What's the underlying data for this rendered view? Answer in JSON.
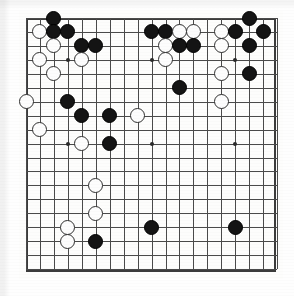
{
  "board": {
    "game": "go",
    "size": 19,
    "title": "Go board position",
    "orientation": "top-left origin, columns 1-19 left to right, rows 1-19 top to bottom",
    "colors": {
      "black_stone": "#141414",
      "white_stone": "#fdfdfd",
      "white_stone_outline": "#2e2e2e",
      "grid_line": "#4a4a4a",
      "border": "#3b3b3b",
      "paper": "#fefefe"
    },
    "geometry": {
      "line1_x": 26,
      "line1_y": 18,
      "cell": 13.95,
      "stone_diameter": 15,
      "border_left": 26,
      "border_top": 18,
      "border_right": 277,
      "border_bottom": 272
    },
    "hoshi": [
      {
        "col": 4,
        "row": 4
      },
      {
        "col": 10,
        "row": 4
      },
      {
        "col": 16,
        "row": 4
      },
      {
        "col": 4,
        "row": 10
      },
      {
        "col": 10,
        "row": 10
      },
      {
        "col": 16,
        "row": 10
      },
      {
        "col": 4,
        "row": 16
      },
      {
        "col": 10,
        "row": 16
      },
      {
        "col": 16,
        "row": 16
      }
    ],
    "counts": {
      "black": 24,
      "white": 16,
      "total": 40
    },
    "stones": [
      {
        "color": "black",
        "col": 3,
        "row": 1
      },
      {
        "color": "black",
        "col": 17,
        "row": 1
      },
      {
        "color": "white",
        "col": 2,
        "row": 2
      },
      {
        "color": "black",
        "col": 3,
        "row": 2
      },
      {
        "color": "black",
        "col": 4,
        "row": 2
      },
      {
        "color": "black",
        "col": 10,
        "row": 2
      },
      {
        "color": "black",
        "col": 11,
        "row": 2
      },
      {
        "color": "white",
        "col": 12,
        "row": 2
      },
      {
        "color": "white",
        "col": 13,
        "row": 2
      },
      {
        "color": "white",
        "col": 15,
        "row": 2
      },
      {
        "color": "black",
        "col": 16,
        "row": 2
      },
      {
        "color": "black",
        "col": 18,
        "row": 2
      },
      {
        "color": "white",
        "col": 3,
        "row": 3
      },
      {
        "color": "black",
        "col": 5,
        "row": 3
      },
      {
        "color": "black",
        "col": 6,
        "row": 3
      },
      {
        "color": "white",
        "col": 11,
        "row": 3
      },
      {
        "color": "black",
        "col": 12,
        "row": 3
      },
      {
        "color": "black",
        "col": 13,
        "row": 3
      },
      {
        "color": "white",
        "col": 15,
        "row": 3
      },
      {
        "color": "black",
        "col": 17,
        "row": 3
      },
      {
        "color": "white",
        "col": 2,
        "row": 4
      },
      {
        "color": "white",
        "col": 5,
        "row": 4
      },
      {
        "color": "white",
        "col": 11,
        "row": 4
      },
      {
        "color": "white",
        "col": 3,
        "row": 5
      },
      {
        "color": "white",
        "col": 15,
        "row": 5
      },
      {
        "color": "black",
        "col": 17,
        "row": 5
      },
      {
        "color": "black",
        "col": 12,
        "row": 6
      },
      {
        "color": "white",
        "col": 1,
        "row": 7
      },
      {
        "color": "black",
        "col": 4,
        "row": 7
      },
      {
        "color": "white",
        "col": 15,
        "row": 7
      },
      {
        "color": "black",
        "col": 5,
        "row": 8
      },
      {
        "color": "black",
        "col": 7,
        "row": 8
      },
      {
        "color": "white",
        "col": 9,
        "row": 8
      },
      {
        "color": "white",
        "col": 2,
        "row": 9
      },
      {
        "color": "white",
        "col": 5,
        "row": 10
      },
      {
        "color": "black",
        "col": 7,
        "row": 10
      },
      {
        "color": "white",
        "col": 6,
        "row": 13
      },
      {
        "color": "white",
        "col": 6,
        "row": 15
      },
      {
        "color": "white",
        "col": 4,
        "row": 16
      },
      {
        "color": "black",
        "col": 10,
        "row": 16
      },
      {
        "color": "black",
        "col": 16,
        "row": 16
      },
      {
        "color": "white",
        "col": 4,
        "row": 17
      },
      {
        "color": "black",
        "col": 6,
        "row": 17
      }
    ]
  }
}
